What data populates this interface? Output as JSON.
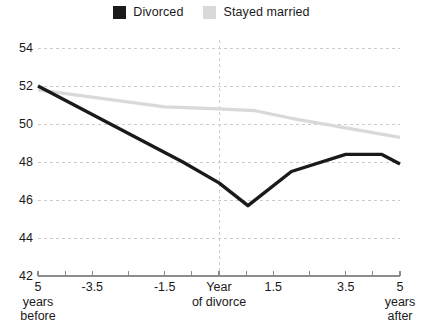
{
  "legend": {
    "items": [
      {
        "label": "Divorced",
        "color": "#1a1a1a",
        "swatch_name": "legend-swatch-divorced"
      },
      {
        "label": "Stayed married",
        "color": "#d9d9d9",
        "swatch_name": "legend-swatch-stayed-married"
      }
    ]
  },
  "axes": {
    "y_ticks": [
      "54",
      "52",
      "50",
      "48",
      "46",
      "44",
      "42"
    ],
    "x_ticks": [
      "5\nyears\nbefore",
      "-3.5",
      "-1.5",
      "Year\nof divorce",
      "1.5",
      "3.5",
      "5\nyears\nafter"
    ]
  },
  "colors": {
    "divorced": "#1a1a1a",
    "stayed_married": "#d9d9d9",
    "grid": "#cccccc",
    "axis": "#8c8c8c",
    "background": "#ffffff"
  },
  "chart_data": {
    "type": "line",
    "title": "",
    "subtitle": "",
    "xlabel": "",
    "ylabel": "",
    "xlim": [
      -5,
      5
    ],
    "ylim": [
      42,
      54
    ],
    "grid": true,
    "legend_position": "top-center",
    "y_ticks": [
      42,
      44,
      46,
      48,
      50,
      52,
      54
    ],
    "x_tick_values": [
      -5,
      -3.5,
      -1.5,
      0,
      1.5,
      3.5,
      5
    ],
    "x_tick_labels": [
      "5 years before",
      "-3.5",
      "-1.5",
      "Year of divorce",
      "1.5",
      "3.5",
      "5 years after"
    ],
    "annotations": [
      {
        "type": "vline",
        "x": 0,
        "style": "dashed",
        "label": "Year of divorce"
      }
    ],
    "series": [
      {
        "name": "Divorced",
        "color": "#1a1a1a",
        "x": [
          -5,
          -1,
          0,
          0.8,
          2,
          3.5,
          4.5,
          5
        ],
        "values": [
          52.0,
          48.0,
          46.9,
          45.7,
          47.5,
          48.4,
          48.4,
          47.9
        ]
      },
      {
        "name": "Stayed married",
        "color": "#d9d9d9",
        "x": [
          -5,
          -1.5,
          0,
          1,
          2,
          3.5,
          5
        ],
        "values": [
          51.8,
          50.9,
          50.8,
          50.7,
          50.3,
          49.8,
          49.3
        ]
      }
    ]
  }
}
